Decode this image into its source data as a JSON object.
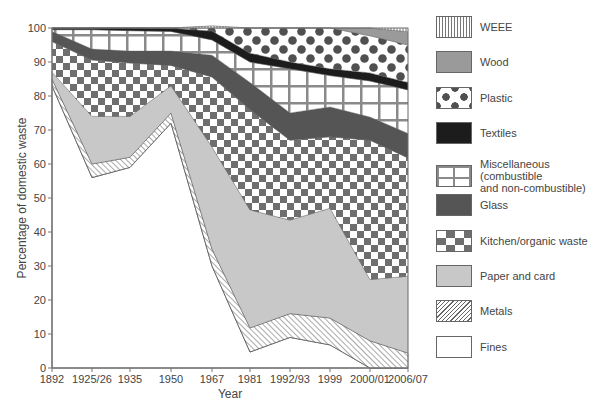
{
  "chart_data": {
    "type": "area",
    "stacked": true,
    "title": "",
    "xlabel": "Year",
    "ylabel": "Percentage of domestic waste",
    "ylim": [
      0,
      100
    ],
    "yticks": [
      0,
      10,
      20,
      30,
      40,
      50,
      60,
      70,
      80,
      90,
      100
    ],
    "grid": false,
    "legend_position": "right",
    "categories": [
      "1892",
      "1925/26",
      "1935",
      "1950",
      "1967",
      "1981",
      "1992/93",
      "1999",
      "2000/01",
      "2006/07"
    ],
    "category_x_px": [
      52,
      92,
      130,
      171,
      212,
      250,
      290,
      330,
      370,
      408
    ],
    "series": [
      {
        "name": "Fines",
        "pattern": "blank",
        "values": [
          83,
          56,
          59,
          72,
          30,
          4.7,
          9,
          6.8,
          0,
          0
        ]
      },
      {
        "name": "Metals",
        "pattern": "hatch",
        "values": [
          2,
          4,
          3,
          3,
          5,
          7.1,
          7,
          7.9,
          8,
          4.4
        ]
      },
      {
        "name": "Paper and card",
        "pattern": "light-grey",
        "values": [
          2,
          14,
          12,
          8,
          30,
          34.7,
          27.5,
          32.3,
          18,
          22.6
        ]
      },
      {
        "name": "Kitchen/organic waste",
        "pattern": "checker",
        "values": [
          9,
          16.6,
          15.7,
          6,
          20.6,
          29.5,
          23.5,
          21,
          41,
          34.8
        ]
      },
      {
        "name": "Glass",
        "pattern": "dark-grey",
        "values": [
          3,
          3.2,
          3.5,
          4.2,
          6.4,
          8,
          8,
          8.8,
          6.8,
          7.2
        ]
      },
      {
        "name": "Miscellaneous (combustible and non-combustible)",
        "pattern": "grid",
        "values": [
          0.5,
          5.7,
          6,
          5.8,
          4.5,
          6,
          13,
          9.2,
          10.6,
          12.8
        ]
      },
      {
        "name": "Textiles",
        "pattern": "black",
        "values": [
          0.5,
          0.5,
          0.8,
          0.9,
          2.6,
          2.6,
          2,
          2,
          2.4,
          2.2
        ]
      },
      {
        "name": "Plastic",
        "pattern": "dots",
        "values": [
          0,
          0,
          0,
          0.1,
          1.5,
          7.4,
          10,
          12,
          10.9,
          11
        ]
      },
      {
        "name": "Wood",
        "pattern": "mid-grey",
        "values": [
          0,
          0,
          0,
          0,
          0,
          0,
          0,
          0,
          2.3,
          3.9
        ]
      },
      {
        "name": "WEEE",
        "pattern": "vertical-lines",
        "values": [
          0,
          0,
          0,
          0,
          0,
          0,
          0,
          0,
          0,
          1.1
        ]
      }
    ]
  },
  "legend": {
    "items": [
      {
        "label": "WEEE",
        "pattern": "vertical-lines"
      },
      {
        "label": "Wood",
        "pattern": "mid-grey"
      },
      {
        "label": "Plastic",
        "pattern": "dots"
      },
      {
        "label": "Textiles",
        "pattern": "black"
      },
      {
        "label": "Miscellaneous (combustible\nand non-combustible)",
        "pattern": "grid"
      },
      {
        "label": "Glass",
        "pattern": "dark-grey"
      },
      {
        "label": "Kitchen/organic waste",
        "pattern": "checker"
      },
      {
        "label": "Paper and card",
        "pattern": "light-grey"
      },
      {
        "label": "Metals",
        "pattern": "hatch"
      },
      {
        "label": "Fines",
        "pattern": "blank"
      }
    ]
  },
  "colors": {
    "axis": "#777777",
    "fines": "#ffffff",
    "metals_hatch": "#555555",
    "paper": "#c8c8c8",
    "checker_dark": "#6e6e6e",
    "glass": "#555555",
    "grid_lines": "#8a8a8a",
    "textiles": "#1c1c1c",
    "plastic_dots": "#505050",
    "wood": "#9a9a9a",
    "weee_lines": "#777777"
  }
}
